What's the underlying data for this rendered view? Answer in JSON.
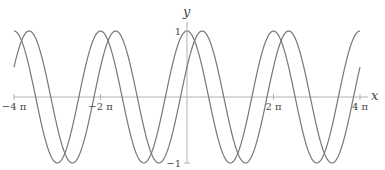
{
  "chart_data": {
    "type": "line",
    "title": "",
    "xlabel": "x",
    "ylabel": "y",
    "xlim": [
      -12.566,
      12.566
    ],
    "ylim": [
      -1,
      1
    ],
    "grid": false,
    "legend": null,
    "x_ticks": [
      {
        "value": -12.566,
        "label": "−4 π"
      },
      {
        "value": -6.283,
        "label": "−2 π"
      },
      {
        "value": 6.283,
        "label": "2 π"
      },
      {
        "value": 12.566,
        "label": "4 π"
      }
    ],
    "y_ticks": [
      {
        "value": 1,
        "label": "1"
      },
      {
        "value": -1,
        "label": "−1"
      }
    ],
    "series": [
      {
        "name": "cos(x)",
        "function": "cos",
        "phase_shift": 0,
        "color": "#777777"
      },
      {
        "name": "cos(x − 1.1)",
        "function": "cos",
        "phase_shift": 1.1,
        "color": "#777777"
      }
    ]
  },
  "colors": {
    "axis": "#aaaaaa",
    "curve": "#777777",
    "text": "#444444"
  }
}
